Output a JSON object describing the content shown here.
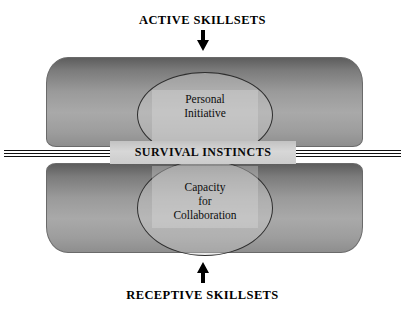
{
  "diagram": {
    "top_caption": "ACTIVE SKILLSETS",
    "bottom_caption": "RECEPTIVE SKILLSETS",
    "center_band_label": "SURVIVAL INSTINCTS",
    "upper_lobe": {
      "line1": "Personal",
      "line2": "Initiative"
    },
    "lower_lobe": {
      "line1": "Capacity",
      "line2": "for",
      "line3": "Collaboration"
    },
    "arrows": {
      "top": "down-arrow",
      "bottom": "up-arrow"
    },
    "colors": {
      "body_dark": "#5d5d5d",
      "body_light": "#a9a9a9",
      "band": "#d7d7d7",
      "outline": "#2e2e2e",
      "text": "#000000",
      "background": "#ffffff"
    }
  }
}
